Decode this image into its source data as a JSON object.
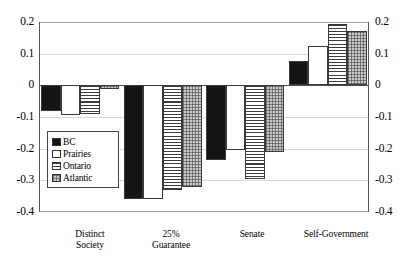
{
  "chart_data": {
    "type": "bar",
    "title": "",
    "subtitle": "",
    "xlabel": "",
    "ylabel": "",
    "ylim": [
      -0.4,
      0.2
    ],
    "ytick_labels": [
      "0.2",
      "0.1",
      "0",
      "-0.1",
      "-0.2",
      "-0.3",
      "-0.4"
    ],
    "ytick_values": [
      0.2,
      0.1,
      0,
      -0.1,
      -0.2,
      -0.3,
      -0.4
    ],
    "grid": true,
    "grid_axis": "y",
    "dual_y_axis": true,
    "legend_position": "inside-lower-left",
    "categories": [
      "Distinct Society",
      "25% Guarantee",
      "Senate",
      "Self-Government"
    ],
    "series": [
      {
        "name": "BC",
        "values": [
          -0.08,
          -0.36,
          -0.235,
          0.078
        ]
      },
      {
        "name": "Prairies",
        "values": [
          -0.095,
          -0.36,
          -0.205,
          0.123
        ]
      },
      {
        "name": "Ontario",
        "values": [
          -0.09,
          -0.33,
          -0.295,
          0.193
        ]
      },
      {
        "name": "Atlantic",
        "values": [
          -0.012,
          -0.32,
          -0.212,
          0.172
        ]
      }
    ]
  },
  "legend": {
    "items": [
      {
        "label": "BC",
        "swatch": "solid-black",
        "color": "#151515"
      },
      {
        "label": "Prairies",
        "swatch": "solid-white",
        "color": "#ffffff"
      },
      {
        "label": "Ontario",
        "swatch": "horizontal-lines",
        "color": "#f2f2f2"
      },
      {
        "label": "Atlantic",
        "swatch": "cross-hatch-gray",
        "color": "#c9c9c9"
      }
    ]
  },
  "axis": {
    "left_ticks": [
      "0.2",
      "0.1",
      "0",
      "-0.1",
      "-0.2",
      "-0.3",
      "-0.4"
    ],
    "right_ticks": [
      "0.2",
      "0.1",
      "0",
      "-0.1",
      "-0.2",
      "-0.3",
      "-0.4"
    ]
  },
  "x_axis": {
    "labels": [
      "Distinct\nSociety",
      "25%\nGuarantee",
      "Senate",
      "Self-Government"
    ]
  }
}
